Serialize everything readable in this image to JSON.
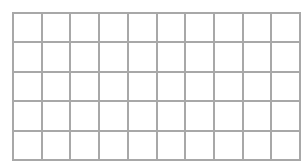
{
  "grid": {
    "rows": 5,
    "columns": 10,
    "line_color": "#a8a8a8",
    "background": "#ffffff"
  }
}
